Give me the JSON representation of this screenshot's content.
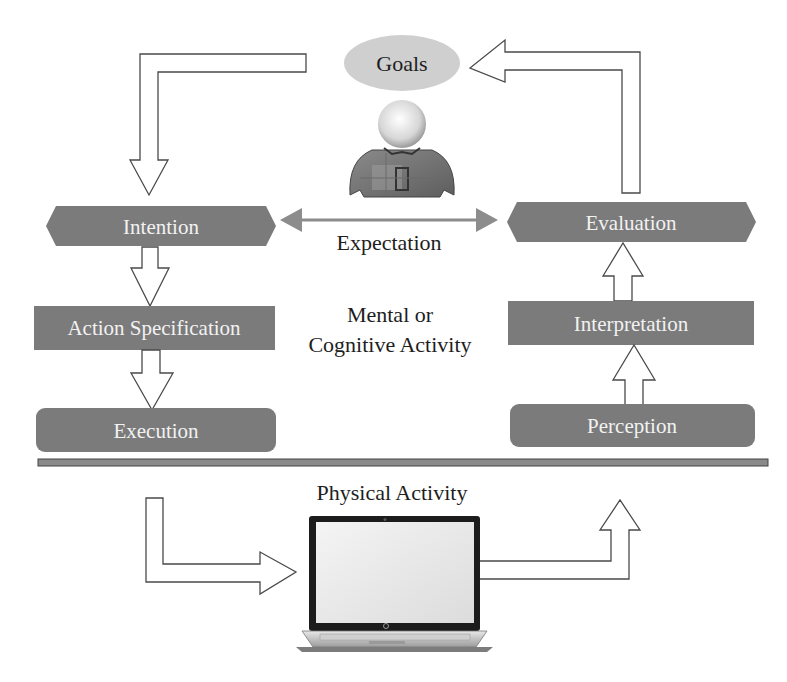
{
  "diagram": {
    "goals": {
      "label": "Goals"
    },
    "expectation": {
      "label": "Expectation"
    },
    "mental_region": {
      "line1": "Mental or",
      "line2": "Cognitive Activity"
    },
    "physical_region": {
      "label": "Physical Activity"
    },
    "execution_side": [
      {
        "id": "intention",
        "label": "Intention",
        "shape": "hexagon"
      },
      {
        "id": "action-specification",
        "label": "Action Specification",
        "shape": "rectangle"
      },
      {
        "id": "execution",
        "label": "Execution",
        "shape": "rounded-rectangle"
      }
    ],
    "evaluation_side": [
      {
        "id": "evaluation",
        "label": "Evaluation",
        "shape": "hexagon"
      },
      {
        "id": "interpretation",
        "label": "Interpretation",
        "shape": "rectangle"
      },
      {
        "id": "perception",
        "label": "Perception",
        "shape": "rounded-rectangle"
      }
    ],
    "icons": {
      "person": "person-icon",
      "laptop": "laptop-icon"
    },
    "colors": {
      "box_fill": "#7b7b7b",
      "goals_fill": "#cfcfcf",
      "divider": "#8a8a8a",
      "arrow_outline": "#4a4a4a",
      "expectation_arrow": "#8c8c8c"
    },
    "edges": [
      {
        "from": "Goals",
        "to": "Intention",
        "style": "hollow-elbow-arrow"
      },
      {
        "from": "Intention",
        "to": "Action Specification",
        "style": "hollow-arrow"
      },
      {
        "from": "Action Specification",
        "to": "Execution",
        "style": "hollow-arrow"
      },
      {
        "from": "Execution",
        "to": "Laptop",
        "style": "hollow-elbow-arrow"
      },
      {
        "from": "Laptop",
        "to": "Perception",
        "style": "hollow-elbow-arrow"
      },
      {
        "from": "Perception",
        "to": "Interpretation",
        "style": "hollow-arrow"
      },
      {
        "from": "Interpretation",
        "to": "Evaluation",
        "style": "hollow-arrow"
      },
      {
        "from": "Evaluation",
        "to": "Goals",
        "style": "hollow-elbow-arrow"
      },
      {
        "from": "Intention",
        "to": "Evaluation",
        "label": "Expectation",
        "style": "double-headed-arrow"
      }
    ]
  }
}
